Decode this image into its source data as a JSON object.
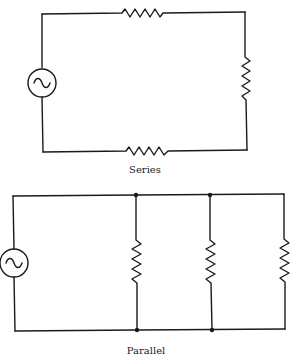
{
  "diagrams": [
    {
      "title": "Series",
      "components": [
        "ac-source",
        "resistor-top",
        "resistor-right",
        "resistor-bottom"
      ]
    },
    {
      "title": "Parallel",
      "components": [
        "ac-source",
        "resistor-branch-1",
        "resistor-branch-2",
        "resistor-branch-3"
      ],
      "junction_nodes": 4
    }
  ],
  "colors": {
    "line": "#1a1a1a",
    "background": "#ffffff"
  }
}
